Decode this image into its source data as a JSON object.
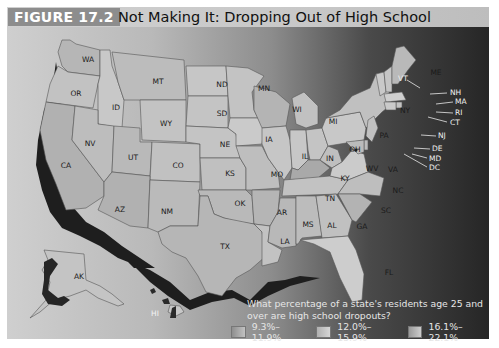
{
  "figure": {
    "label": "FIGURE 17.2",
    "title": "Not Making It: Dropping Out of High School"
  },
  "legend": {
    "question": "What percentage of a state's residents age 25 and over are high school dropouts?",
    "items": [
      {
        "label": "9.3%–11.9%",
        "color": "#a8a8a8"
      },
      {
        "label": "12.0%–15.9%",
        "color": "#c4c4c4"
      },
      {
        "label": "16.1%–22.1%",
        "color": "#b4b4b4"
      }
    ]
  },
  "states": {
    "WA": "WA",
    "OR": "OR",
    "CA": "CA",
    "ID": "ID",
    "NV": "NV",
    "MT": "MT",
    "WY": "WY",
    "UT": "UT",
    "AZ": "AZ",
    "CO": "CO",
    "NM": "NM",
    "ND": "ND",
    "SD": "SD",
    "NE": "NE",
    "KS": "KS",
    "OK": "OK",
    "TX": "TX",
    "MN": "MN",
    "IA": "IA",
    "MO": "MO",
    "AR": "AR",
    "LA": "LA",
    "WI": "WI",
    "IL": "IL",
    "MS": "MS",
    "MI": "MI",
    "IN": "IN",
    "KY": "KY",
    "TN": "TN",
    "AL": "AL",
    "GA": "GA",
    "FL": "FL",
    "OH": "OH",
    "WV": "WV",
    "VA": "VA",
    "NC": "NC",
    "SC": "SC",
    "PA": "PA",
    "NY": "NY",
    "VT": "VT",
    "NH": "NH",
    "ME": "ME",
    "MA": "MA",
    "RI": "RI",
    "CT": "CT",
    "NJ": "NJ",
    "DE": "DE",
    "MD": "MD",
    "DC": "DC",
    "AK": "AK",
    "HI": "HI"
  }
}
